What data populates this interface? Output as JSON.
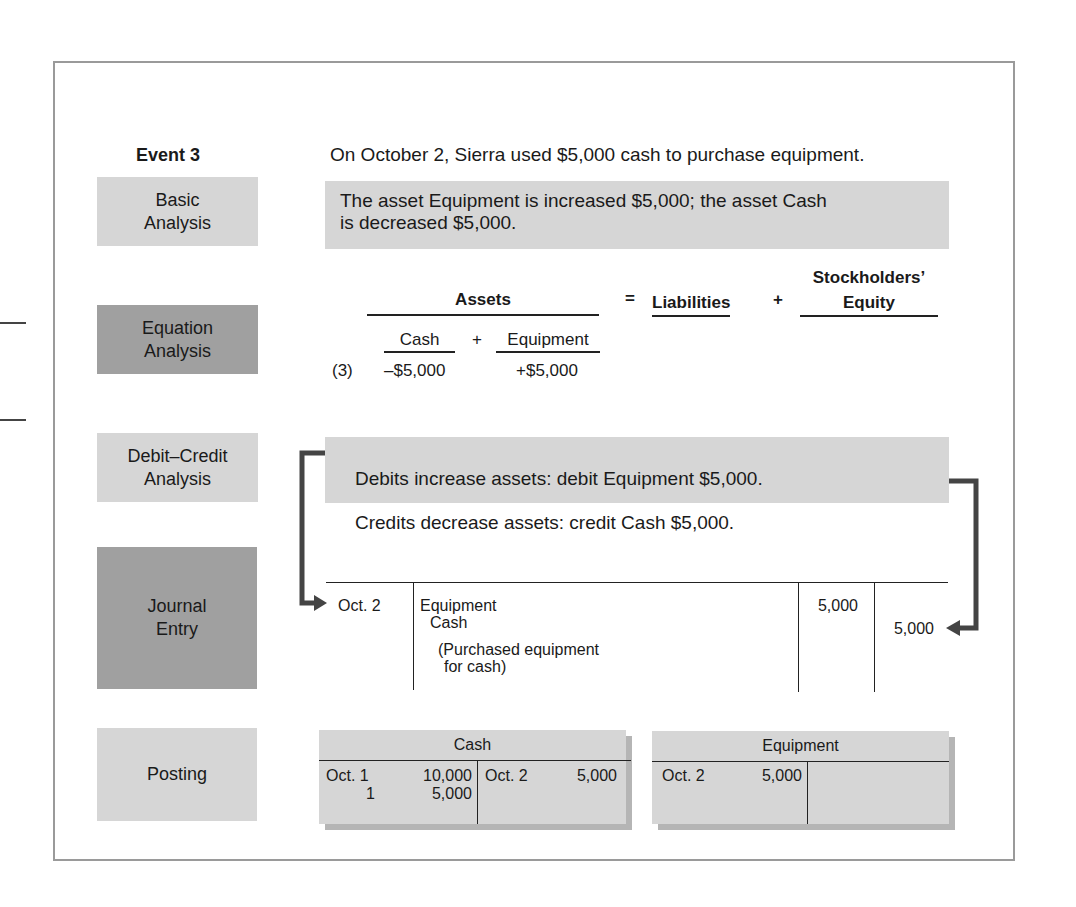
{
  "event": {
    "title": "Event 3",
    "description": "On October 2, Sierra used $5,000 cash to purchase equipment."
  },
  "steps": [
    {
      "label": "Basic\nAnalysis",
      "shade": "light"
    },
    {
      "label": "Equation\nAnalysis",
      "shade": "dark"
    },
    {
      "label": "Debit–Credit\nAnalysis",
      "shade": "light"
    },
    {
      "label": "Journal\nEntry",
      "shade": "dark"
    },
    {
      "label": "Posting",
      "shade": "light"
    }
  ],
  "basic_analysis": {
    "text": "The asset Equipment is increased $5,000; the asset Cash\nis decreased $5,000."
  },
  "equation_analysis": {
    "assets_header": "Assets",
    "equals": "=",
    "liabilities_header": "Liabilities",
    "plus": "+",
    "equity_header_line1": "Stockholders’",
    "equity_header_line2": "Equity",
    "sub_cash": "Cash",
    "sub_plus": "+",
    "sub_equipment": "Equipment",
    "row_ref": "(3)",
    "cash_change": "–$5,000",
    "equipment_change": "+$5,000"
  },
  "debit_credit_analysis": {
    "line1": "Debits increase assets: debit Equipment $5,000.",
    "line2": "Credits decrease assets: credit Cash $5,000."
  },
  "journal_entry": {
    "date": "Oct. 2",
    "debit_account": "Equipment",
    "credit_account": "Cash",
    "explanation_line1": "(Purchased equipment",
    "explanation_line2": "for cash)",
    "debit_amount": "5,000",
    "credit_amount": "5,000"
  },
  "posting": {
    "cash": {
      "title": "Cash",
      "debits": [
        {
          "date": "Oct. 1",
          "amount": "10,000"
        },
        {
          "date": "1",
          "amount": "5,000"
        }
      ],
      "credits": [
        {
          "date": "Oct. 2",
          "amount": "5,000"
        }
      ]
    },
    "equipment": {
      "title": "Equipment",
      "debits": [
        {
          "date": "Oct. 2",
          "amount": "5,000"
        }
      ],
      "credits": []
    }
  },
  "colors": {
    "light_panel": "#d6d6d6",
    "dark_panel": "#a0a0a0",
    "arrow": "#444444",
    "frame": "#9a9a9a"
  }
}
